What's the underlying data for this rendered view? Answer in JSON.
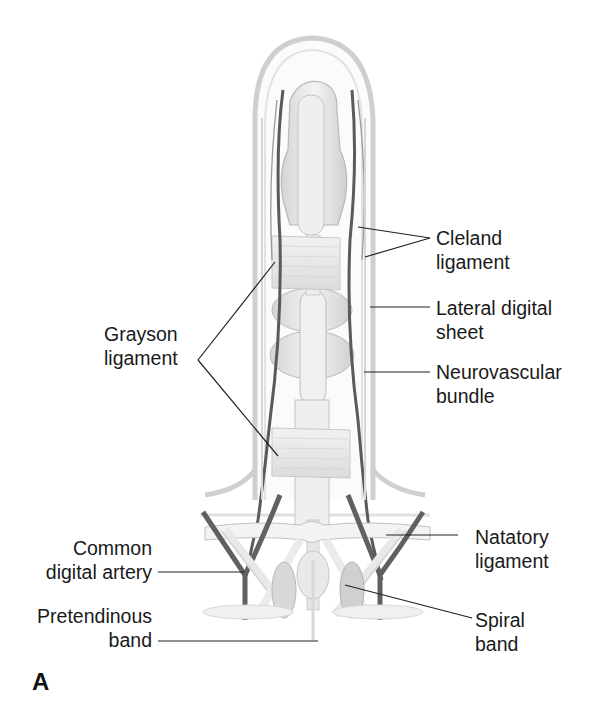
{
  "figure": {
    "panel_letter": "A",
    "labels": {
      "cleland": {
        "line1": "Cleland",
        "line2": "ligament"
      },
      "lateral_digital": {
        "line1": "Lateral digital",
        "line2": "sheet"
      },
      "neurovascular": {
        "line1": "Neurovascular",
        "line2": "bundle"
      },
      "grayson": {
        "line1": "Grayson",
        "line2": "ligament"
      },
      "natatory": {
        "line1": "Natatory",
        "line2": "ligament"
      },
      "common_digital": {
        "line1": "Common",
        "line2": "digital artery"
      },
      "pretendinous": {
        "line1": "Pretendinous",
        "line2": "band"
      },
      "spiral": {
        "line1": "Spiral",
        "line2": "band"
      }
    },
    "colors": {
      "outline": "#c8c8c8",
      "tendon": "#ebebeb",
      "shadow": "#b5b5b5",
      "vessel": "#5a5a5a",
      "leader": "#222222",
      "text": "#1a1a1a"
    }
  }
}
